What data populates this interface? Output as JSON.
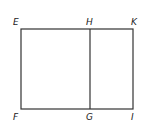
{
  "diagram": {
    "type": "geometric-rectangle-division",
    "stroke_color": "#333333",
    "background": "#ffffff",
    "points": [
      {
        "label": "E",
        "x": 21,
        "y": 29
      },
      {
        "label": "H",
        "x": 90,
        "y": 29
      },
      {
        "label": "K",
        "x": 133,
        "y": 29
      },
      {
        "label": "F",
        "x": 21,
        "y": 109
      },
      {
        "label": "G",
        "x": 90,
        "y": 109
      },
      {
        "label": "I",
        "x": 133,
        "y": 109
      }
    ],
    "labels": {
      "E": "E",
      "H": "H",
      "K": "K",
      "F": "F",
      "G": "G",
      "I": "I"
    },
    "segments": [
      "EK",
      "KI",
      "IF",
      "FE",
      "HG"
    ]
  }
}
